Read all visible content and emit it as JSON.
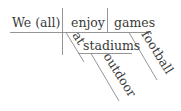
{
  "diagram": {
    "type": "sentence-diagram",
    "subject": "We (all)",
    "verb": "enjoy",
    "object": "games",
    "modifiers": {
      "object_adjective": "football",
      "preposition": "at",
      "prep_object": "stadiums",
      "prep_object_adjective": "outdoor"
    },
    "colors": {
      "text": "#3a3a3a",
      "lines": "#8a8a8a",
      "background": "#ffffff"
    }
  }
}
